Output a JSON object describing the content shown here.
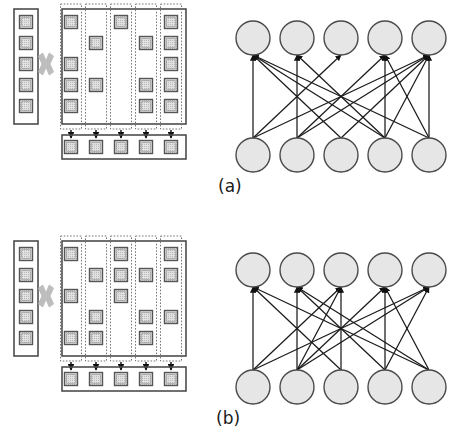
{
  "figure": {
    "panels": [
      {
        "id": "a",
        "label": "(a)",
        "label_x": 218,
        "label_y": 192,
        "caption_note": "unbalanced / irregular sparsity",
        "matrix": {
          "rows": 5,
          "cols": 5,
          "column_nonzero_rows": [
            [
              1,
              3,
              4,
              5
            ],
            [
              2,
              4
            ],
            [
              1
            ],
            [
              2,
              4,
              5
            ],
            [
              1,
              2,
              3,
              4,
              5
            ]
          ],
          "column_nonzero_counts": [
            4,
            2,
            1,
            3,
            5
          ]
        },
        "input_vector": {
          "length": 5,
          "filled": [
            1,
            1,
            1,
            1,
            1
          ]
        },
        "output_vector": {
          "length": 5,
          "filled": [
            1,
            1,
            1,
            1,
            1
          ]
        },
        "operator_symbol": "✖",
        "network": {
          "top_nodes": 5,
          "bottom_nodes": 5,
          "edges": [
            [
              1,
              1
            ],
            [
              3,
              1
            ],
            [
              4,
              1
            ],
            [
              5,
              1
            ],
            [
              2,
              2
            ],
            [
              4,
              2
            ],
            [
              1,
              3
            ],
            [
              2,
              4
            ],
            [
              4,
              4
            ],
            [
              5,
              4
            ],
            [
              1,
              5
            ],
            [
              2,
              5
            ],
            [
              3,
              5
            ],
            [
              4,
              5
            ],
            [
              5,
              5
            ]
          ],
          "top_node_in_degree": [
            4,
            2,
            1,
            3,
            5
          ]
        }
      },
      {
        "id": "b",
        "label": "(b)",
        "label_x": 216,
        "label_y": 424,
        "caption_note": "balanced / regular sparsity",
        "matrix": {
          "rows": 5,
          "cols": 5,
          "column_nonzero_rows": [
            [
              1,
              3,
              5
            ],
            [
              2,
              4,
              5
            ],
            [
              1,
              2,
              3
            ],
            [
              2,
              4,
              5
            ],
            [
              1,
              2,
              4
            ]
          ],
          "column_nonzero_counts": [
            3,
            3,
            3,
            3,
            3
          ]
        },
        "input_vector": {
          "length": 5,
          "filled": [
            1,
            1,
            1,
            1,
            1
          ]
        },
        "output_vector": {
          "length": 5,
          "filled": [
            1,
            1,
            1,
            1,
            1
          ]
        },
        "operator_symbol": "✖",
        "network": {
          "top_nodes": 5,
          "bottom_nodes": 5,
          "edges": [
            [
              1,
              1
            ],
            [
              3,
              1
            ],
            [
              5,
              1
            ],
            [
              2,
              2
            ],
            [
              4,
              2
            ],
            [
              5,
              2
            ],
            [
              1,
              3
            ],
            [
              2,
              3
            ],
            [
              3,
              3
            ],
            [
              2,
              4
            ],
            [
              4,
              4
            ],
            [
              5,
              4
            ],
            [
              1,
              5
            ],
            [
              2,
              5
            ],
            [
              4,
              5
            ]
          ],
          "top_node_in_degree": [
            3,
            3,
            3,
            3,
            3
          ]
        }
      }
    ],
    "colors": {
      "cell_fill": "#dcdcdc",
      "cell_stroke": "#555555",
      "container_stroke": "#4d4d4d",
      "dashed_stroke": "#777777",
      "node_fill": "#e6e6e6",
      "node_stroke": "#4a4a4a",
      "edge_stroke": "#1a1a1a",
      "operator_color": "#bdbdbd",
      "background": "#ffffff",
      "label_color": "#1a1a1a"
    },
    "geometry": {
      "panel_a_offset_y": 0,
      "panel_b_offset_y": 232,
      "input_vector_x": 14,
      "matrix_x": 62,
      "matrix_width": 124,
      "cell_size": 13,
      "col_pitch": 25,
      "row_pitch": 21,
      "output_vector_y": 146,
      "network_x_positions": [
        253,
        297,
        341,
        385,
        429
      ],
      "network_top_y": 38,
      "network_bottom_y": 155,
      "node_radius": 17
    }
  }
}
